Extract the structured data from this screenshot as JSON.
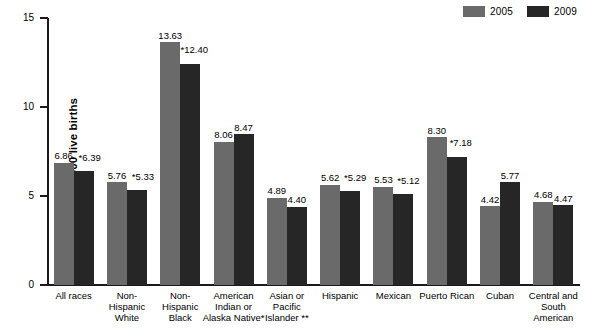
{
  "chart_data": {
    "type": "bar",
    "title": "",
    "xlabel": "",
    "ylabel": "Rate per 1,000 live births",
    "ylim": [
      0,
      15
    ],
    "yticks": [
      0,
      5,
      10,
      15
    ],
    "grid": false,
    "legend_position": "top-right",
    "categories": [
      "All races",
      "Non-Hispanic White",
      "Non-Hispanic Black",
      "American Indian or Alaska Native*",
      "Asian or Pacific Islander **",
      "Hispanic",
      "Mexican",
      "Puerto Rican",
      "Cuban",
      "Central and South American"
    ],
    "category_lines": [
      [
        "All races"
      ],
      [
        "Non-",
        "Hispanic",
        "White"
      ],
      [
        "Non-",
        "Hispanic",
        "Black"
      ],
      [
        "American",
        "Indian or",
        "Alaska Native*"
      ],
      [
        "Asian or",
        "Pacific",
        "Islander **"
      ],
      [
        "Hispanic"
      ],
      [
        "Mexican"
      ],
      [
        "Puerto Rican"
      ],
      [
        "Cuban"
      ],
      [
        "Central and",
        "South",
        "American"
      ]
    ],
    "series": [
      {
        "name": "2005",
        "color": "#6a6a6a",
        "values": [
          6.86,
          5.76,
          13.63,
          8.06,
          4.89,
          5.62,
          5.53,
          8.3,
          4.42,
          4.68
        ],
        "labels": [
          "6.86",
          "5.76",
          "13.63",
          "8.06",
          "4.89",
          "5.62",
          "5.53",
          "8.30",
          "4.42",
          "4.68"
        ]
      },
      {
        "name": "2009",
        "color": "#262626",
        "values": [
          6.39,
          5.33,
          12.4,
          8.47,
          4.4,
          5.29,
          5.12,
          7.18,
          5.77,
          4.47
        ],
        "labels": [
          "*6.39",
          "*5.33",
          "*12.40",
          "8.47",
          "4.40",
          "*5.29",
          "*5.12",
          "*7.18",
          "5.77",
          "4.47"
        ]
      }
    ]
  },
  "legend": {
    "entries": [
      {
        "label": "2005",
        "color": "#6a6a6a"
      },
      {
        "label": "2009",
        "color": "#262626"
      }
    ]
  },
  "axis": {
    "y_title": "Rate per 1,000 live births",
    "y_tick_labels": [
      "15",
      "10",
      "5",
      "0"
    ]
  }
}
